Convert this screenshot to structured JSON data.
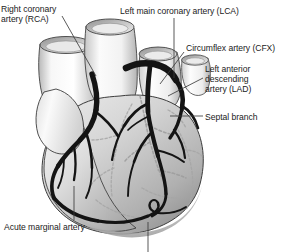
{
  "figure": {
    "background_color": "#ffffff",
    "artery_color": "#141414",
    "deep_vessel_color": "#9a9a9a",
    "myocardium_light": "#f2f2f2",
    "myocardium_mid": "#cfcfcf",
    "myocardium_dark": "#9d9d9d",
    "outline_color": "#3a3a3a",
    "leader_color": "#3c3c3c"
  },
  "labels": {
    "rca": "Right coronary\nartery (RCA)",
    "lca": "Left main coronary artery (LCA)",
    "cfx": "Circumflex artery (CFX)",
    "lad": "Left anterior\ndescending\nartery (LAD)",
    "septal": "Septal branch",
    "acute_marginal": "Acute marginal artery"
  },
  "structures": [
    {
      "name": "superior-vena-cava",
      "kind": "great-vessel"
    },
    {
      "name": "aorta",
      "kind": "great-vessel"
    },
    {
      "name": "pulmonary-artery",
      "kind": "great-vessel"
    },
    {
      "name": "pulmonary-vein-stump",
      "kind": "great-vessel"
    },
    {
      "name": "right-atrium",
      "kind": "chamber"
    },
    {
      "name": "right-ventricle",
      "kind": "chamber"
    },
    {
      "name": "left-ventricle",
      "kind": "chamber"
    },
    {
      "name": "right-coronary-artery",
      "kind": "artery"
    },
    {
      "name": "acute-marginal-artery",
      "kind": "artery"
    },
    {
      "name": "left-main-coronary-artery",
      "kind": "artery"
    },
    {
      "name": "circumflex-artery",
      "kind": "artery"
    },
    {
      "name": "left-anterior-descending-artery",
      "kind": "artery"
    },
    {
      "name": "septal-branch",
      "kind": "deep-artery"
    },
    {
      "name": "diagonal-branches",
      "kind": "artery"
    }
  ]
}
